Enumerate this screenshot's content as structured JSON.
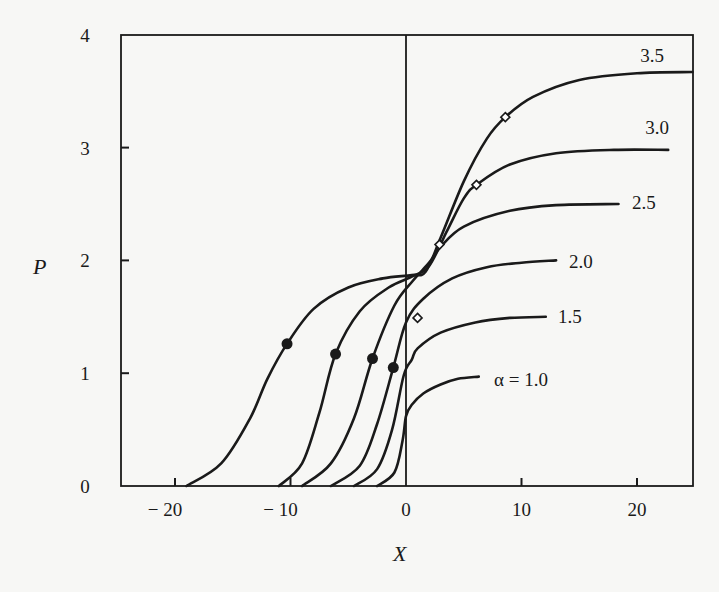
{
  "chart_data": {
    "type": "line",
    "title": "",
    "xlabel": "X",
    "ylabel": "P",
    "xlim": [
      -25,
      25
    ],
    "ylim": [
      0,
      4
    ],
    "grid": false,
    "legend": "inline curve labels at right end of each curve",
    "x_ticks": [
      -20,
      -10,
      0,
      10,
      20
    ],
    "x_tick_labels": [
      "− 20",
      "− 10",
      "0",
      "10",
      "20"
    ],
    "y_ticks": [
      0,
      1,
      2,
      3,
      4
    ],
    "y_tick_labels": [
      "0",
      "1",
      "2",
      "3",
      "4"
    ],
    "vertical_reference_line_x": 0,
    "series": [
      {
        "name": "α = 1.0",
        "label": "α = 1.0",
        "plateau": 0.98,
        "points": [
          [
            -2.5,
            0.0
          ],
          [
            -1.0,
            0.12
          ],
          [
            -0.3,
            0.4
          ],
          [
            0.0,
            0.62
          ],
          [
            0.5,
            0.72
          ],
          [
            1.5,
            0.82
          ],
          [
            3.0,
            0.9
          ],
          [
            4.5,
            0.95
          ],
          [
            6.3,
            0.97
          ]
        ]
      },
      {
        "name": "α = 1.5",
        "label": "1.5",
        "plateau": 1.5,
        "points": [
          [
            -4.5,
            0.0
          ],
          [
            -2.5,
            0.15
          ],
          [
            -1.2,
            0.5
          ],
          [
            -0.2,
            0.98
          ],
          [
            0.5,
            1.12
          ],
          [
            1.0,
            1.22
          ],
          [
            3.0,
            1.36
          ],
          [
            6.0,
            1.45
          ],
          [
            9.0,
            1.49
          ],
          [
            12.1,
            1.5
          ]
        ],
        "open_marker": [
          1.0,
          1.49
        ]
      },
      {
        "name": "α = 2.0",
        "label": "2.0",
        "plateau": 2.0,
        "points": [
          [
            -6.5,
            0.0
          ],
          [
            -4.0,
            0.18
          ],
          [
            -2.5,
            0.55
          ],
          [
            -1.1,
            1.05
          ],
          [
            0.0,
            1.45
          ],
          [
            1.5,
            1.66
          ],
          [
            4.0,
            1.84
          ],
          [
            7.0,
            1.94
          ],
          [
            10.0,
            1.98
          ],
          [
            13.0,
            2.0
          ]
        ],
        "filled_marker": [
          -1.1,
          1.05
        ]
      },
      {
        "name": "α = 2.5",
        "label": "2.5",
        "plateau": 2.5,
        "points": [
          [
            -9.0,
            0.0
          ],
          [
            -6.5,
            0.2
          ],
          [
            -4.5,
            0.6
          ],
          [
            -2.9,
            1.13
          ],
          [
            -1.0,
            1.6
          ],
          [
            0.6,
            1.82
          ],
          [
            2.0,
            1.98
          ],
          [
            3.0,
            2.12
          ],
          [
            5.0,
            2.3
          ],
          [
            9.0,
            2.44
          ],
          [
            13.0,
            2.49
          ],
          [
            18.4,
            2.5
          ]
        ],
        "filled_marker": [
          -2.9,
          1.13
        ],
        "open_marker": [
          2.9,
          2.14
        ]
      },
      {
        "name": "α = 3.0",
        "label": "3.0",
        "plateau": 2.98,
        "points": [
          [
            -11.0,
            0.0
          ],
          [
            -9.0,
            0.2
          ],
          [
            -7.5,
            0.65
          ],
          [
            -6.1,
            1.17
          ],
          [
            -4.0,
            1.55
          ],
          [
            -1.5,
            1.76
          ],
          [
            0.6,
            1.86
          ],
          [
            2.0,
            1.95
          ],
          [
            3.5,
            2.25
          ],
          [
            5.0,
            2.55
          ],
          [
            6.1,
            2.67
          ],
          [
            9.0,
            2.85
          ],
          [
            13.0,
            2.95
          ],
          [
            18.0,
            2.98
          ],
          [
            22.7,
            2.98
          ]
        ],
        "filled_marker": [
          -6.1,
          1.17
        ],
        "open_marker": [
          6.1,
          2.67
        ]
      },
      {
        "name": "α = 3.5",
        "label": "3.5",
        "plateau": 3.67,
        "points": [
          [
            -19.0,
            0.0
          ],
          [
            -16.0,
            0.2
          ],
          [
            -13.5,
            0.6
          ],
          [
            -12.0,
            0.95
          ],
          [
            -10.3,
            1.26
          ],
          [
            -8.0,
            1.57
          ],
          [
            -5.0,
            1.76
          ],
          [
            -2.0,
            1.84
          ],
          [
            0.5,
            1.87
          ],
          [
            1.7,
            1.9
          ],
          [
            3.0,
            2.2
          ],
          [
            5.0,
            2.7
          ],
          [
            7.0,
            3.08
          ],
          [
            8.6,
            3.27
          ],
          [
            11.0,
            3.45
          ],
          [
            15.0,
            3.6
          ],
          [
            20.0,
            3.66
          ],
          [
            24.8,
            3.67
          ]
        ],
        "filled_marker": [
          -10.3,
          1.26
        ],
        "open_marker": [
          8.6,
          3.27
        ]
      }
    ]
  }
}
